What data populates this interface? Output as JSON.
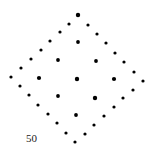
{
  "diagram": {
    "label": "50",
    "dot_color": "#000000",
    "outer_dots": [
      [
        78,
        15,
        2.2
      ],
      [
        69,
        24,
        1.6
      ],
      [
        60,
        32,
        1.6
      ],
      [
        50,
        41,
        1.6
      ],
      [
        41,
        50,
        1.6
      ],
      [
        31,
        59,
        1.6
      ],
      [
        21,
        68,
        1.6
      ],
      [
        11,
        77,
        1.6
      ],
      [
        88,
        25,
        1.6
      ],
      [
        97,
        34,
        1.6
      ],
      [
        106,
        43,
        1.6
      ],
      [
        115,
        53,
        1.6
      ],
      [
        124,
        62,
        1.6
      ],
      [
        134,
        72,
        1.6
      ],
      [
        143,
        81,
        1.6
      ],
      [
        20,
        86,
        1.6
      ],
      [
        29,
        95,
        1.6
      ],
      [
        38,
        105,
        1.6
      ],
      [
        48,
        114,
        1.6
      ],
      [
        57,
        123,
        1.6
      ],
      [
        66,
        133,
        1.6
      ],
      [
        75,
        142,
        1.6
      ],
      [
        133,
        90,
        1.6
      ],
      [
        123,
        98,
        1.6
      ],
      [
        114,
        107,
        1.6
      ],
      [
        104,
        116,
        1.6
      ],
      [
        94,
        125,
        1.6
      ],
      [
        85,
        134,
        1.6
      ]
    ],
    "inner_dots": [
      [
        78,
        42,
        1.9
      ],
      [
        58,
        60,
        1.9
      ],
      [
        96,
        61,
        1.9
      ],
      [
        39,
        78,
        2.1
      ],
      [
        77,
        79,
        2.2
      ],
      [
        114,
        79,
        2.1
      ],
      [
        58,
        96,
        1.9
      ],
      [
        95,
        98,
        2.2
      ],
      [
        76,
        115,
        1.9
      ]
    ]
  }
}
